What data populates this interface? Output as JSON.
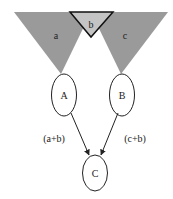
{
  "triangles": {
    "a": {
      "label": "a",
      "color": "#9a9a9a"
    },
    "b": {
      "label": "b",
      "color": "#c4c4c4"
    },
    "c": {
      "label": "c",
      "color": "#9a9a9a"
    }
  },
  "nodes": {
    "A": {
      "label": "A"
    },
    "B": {
      "label": "B"
    },
    "C": {
      "label": "C"
    }
  },
  "edges": {
    "A_C": {
      "label": "(a+b)"
    },
    "B_C": {
      "label": "(c+b)"
    }
  }
}
